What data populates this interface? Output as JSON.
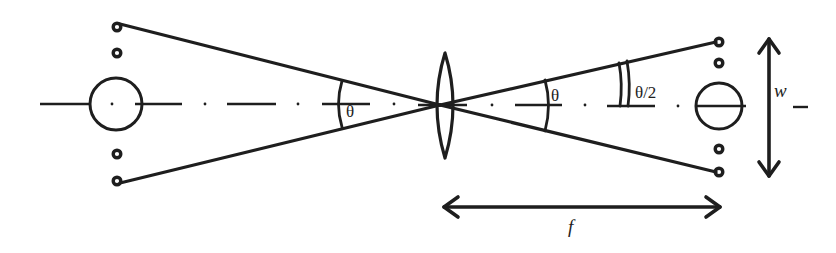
{
  "diagram": {
    "type": "optics-schematic",
    "colors": {
      "stroke": "#1e1e1e",
      "background": "#ffffff"
    },
    "labels": {
      "left_angle": "θ",
      "right_angle": "θ",
      "half_angle": "θ/2",
      "width": "w",
      "focal_length": "f"
    },
    "elements": {
      "left_plane": {
        "small_circles_y": [
          27,
          53,
          154,
          181
        ],
        "x": 117,
        "large_circle": {
          "cx": 116,
          "cy": 104,
          "r": 26
        }
      },
      "lens": {
        "cx": 445,
        "top": 53,
        "bottom": 158,
        "half_width": 12
      },
      "right_plane": {
        "small_circles_y": [
          43,
          63,
          149,
          172
        ],
        "x": 719,
        "large_circle": {
          "cx": 719,
          "cy": 106,
          "r": 23
        }
      },
      "width_arrow": {
        "x": 769,
        "y1": 37,
        "y2": 177
      },
      "focal_arrow": {
        "y": 207,
        "x1": 442,
        "x2": 722
      }
    }
  }
}
